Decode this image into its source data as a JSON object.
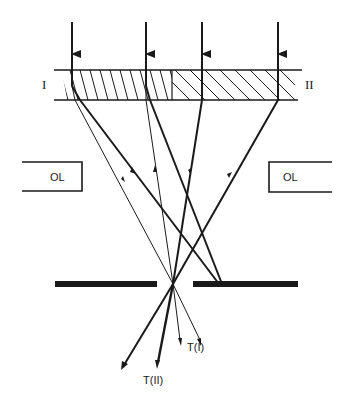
{
  "figure": {
    "region_labels": {
      "left": "I",
      "right": "II"
    },
    "lens_labels": {
      "left": "OL",
      "right": "OL"
    },
    "beam_labels": {
      "t1": "T(I)",
      "t2": "T(II)"
    },
    "colors": {
      "ink": "#1a1a1a",
      "paper": "#ffffff"
    }
  }
}
